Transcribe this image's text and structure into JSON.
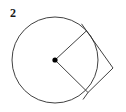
{
  "figure": {
    "label": "2",
    "background_color": "#ffffff",
    "stroke_color": "#2b2b2b",
    "stroke_width": 0.9,
    "center_dot_color": "#000000",
    "center_dot_radius": 2.6
  },
  "geometry": {
    "circle": {
      "center_x": 55,
      "center_y": 60,
      "radius": 43
    },
    "center_point": {
      "x": 55,
      "y": 60,
      "name": "center"
    },
    "tangent_point_upper": {
      "x": 86.5,
      "y": 30.8,
      "name": "upper-tangency"
    },
    "tangent_point_lower": {
      "x": 88.0,
      "y": 92.5,
      "name": "lower-tangency"
    },
    "external_point": {
      "x": 113,
      "y": 68,
      "name": "external-vertex"
    },
    "radius_upper": {
      "x1": 55,
      "y1": 60,
      "x2": 86.5,
      "y2": 30.8
    },
    "radius_lower": {
      "x1": 55,
      "y1": 60,
      "x2": 88.0,
      "y2": 92.5
    },
    "tangent_upper": {
      "x1": 86.5,
      "y1": 30.8,
      "x2": 113,
      "y2": 68
    },
    "tangent_lower": {
      "x1": 88.0,
      "y1": 92.5,
      "x2": 113,
      "y2": 68
    },
    "tangent_overshoot_upper": {
      "x1": 81.5,
      "y1": 23.8,
      "x2": 86.5,
      "y2": 30.8
    },
    "tangent_overshoot_lower": {
      "x1": 83.0,
      "y1": 99.5,
      "x2": 88.0,
      "y2": 92.5
    }
  }
}
